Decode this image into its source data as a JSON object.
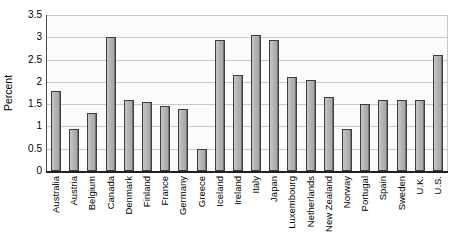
{
  "chart_data": {
    "type": "bar",
    "title": "",
    "xlabel": "",
    "ylabel": "Percent",
    "ylim": [
      0,
      3.5
    ],
    "ytick_step": 0.5,
    "ytick_labels": [
      "3.5",
      "3",
      "2.5",
      "2",
      "1.5",
      "1",
      "0.5",
      "0"
    ],
    "grid": true,
    "legend": "none",
    "categories": [
      "Australia",
      "Austria",
      "Belgium",
      "Canada",
      "Denmark",
      "Finland",
      "France",
      "Germany",
      "Greece",
      "Iceland",
      "Ireland",
      "Italy",
      "Japan",
      "Luxembourg",
      "Netherlands",
      "New Zealand",
      "Norway",
      "Portugal",
      "Spain",
      "Sweden",
      "U.K.",
      "U.S."
    ],
    "values": [
      1.8,
      0.95,
      1.3,
      3.0,
      1.6,
      1.55,
      1.45,
      1.4,
      0.5,
      2.95,
      2.15,
      3.05,
      2.95,
      2.1,
      2.05,
      1.65,
      0.95,
      1.5,
      1.6,
      1.6,
      1.6,
      2.6
    ],
    "colors": {
      "bar_fill": "#b3b3b3",
      "bar_border": "#3d3d3d",
      "gridline": "#c9c9c9",
      "axis": "#1f1f1f",
      "plot_background": "#fcfcfc",
      "page_background": "#ffffff",
      "text": "#000000"
    }
  }
}
